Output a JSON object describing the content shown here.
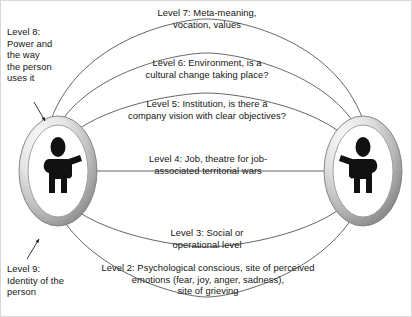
{
  "diagram": {
    "title_absent": true,
    "type": "concentric-levels-relationship-diagram",
    "actors": [
      {
        "name": "person-left",
        "icon": "person-figure-icon",
        "position": "left"
      },
      {
        "name": "person-right",
        "icon": "person-figure-icon",
        "position": "right"
      }
    ],
    "levels": [
      {
        "id": "level7",
        "label": "Level 7: Meta-meaning,\nvocation, values"
      },
      {
        "id": "level6",
        "label": "Level 6: Environment, is a\ncultural change taking place?"
      },
      {
        "id": "level5",
        "label": "Level 5: Institution, is there a\ncompany vision with clear objectives?"
      },
      {
        "id": "level4",
        "label": "Level 4: Job, theatre for job-\nassociated territorial wars"
      },
      {
        "id": "level3",
        "label": "Level 3: Social or\noperational level"
      },
      {
        "id": "level2",
        "label": "Level 2: Psychological conscious, site of perceived\nemotions (fear, joy, anger, sadness),\nsite of grieving"
      },
      {
        "id": "level8",
        "label": "Level 8:\nPower and\nthe way\nthe person\nuses it"
      },
      {
        "id": "level9",
        "label": "Level 9:\nIdentity of the\nperson"
      }
    ],
    "annotations": [
      {
        "id": "arrow-level8",
        "name": "level8-pointer-arrow",
        "target": "person-left-ring-top"
      },
      {
        "id": "arrow-level9",
        "name": "level9-pointer-arrow",
        "target": "person-left-ring-bottom"
      }
    ],
    "colors": {
      "stroke": "#3a3a3a",
      "text": "#151515",
      "ring_light": "#f2f2f2",
      "ring_mid": "#c9c9c9",
      "ring_dark": "#8c8c8c",
      "figure": "#111111",
      "background": "#ffffff",
      "frame": "#d8d8d8"
    }
  }
}
